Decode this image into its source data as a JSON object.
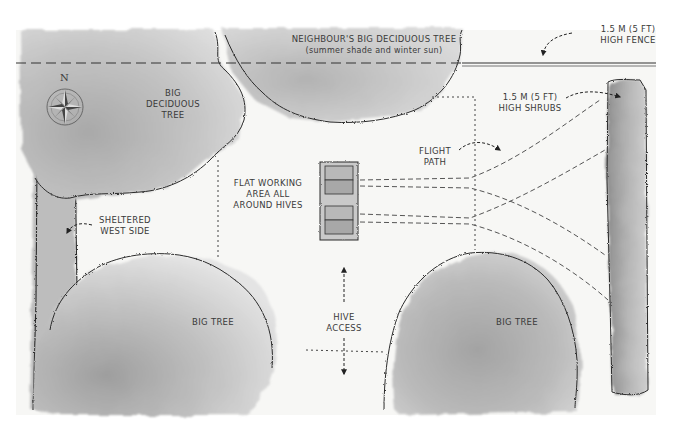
{
  "diagram": {
    "type": "garden beehive siting plan",
    "style": "grayscale watercolor",
    "labels": {
      "neighbour_tree_title": "NEIGHBOUR'S BIG DECIDUOUS TREE",
      "neighbour_tree_note": "(summer shade and winter sun)",
      "fence_line1": "1.5 M (5 FT)",
      "fence_line2": "HIGH FENCE",
      "shrubs_line1": "1.5 M (5 FT)",
      "shrubs_line2": "HIGH SHRUBS",
      "big_deciduous_line1": "BIG",
      "big_deciduous_line2": "DECIDUOUS",
      "big_deciduous_line3": "TREE",
      "north": "N",
      "flight_line1": "FLIGHT",
      "flight_line2": "PATH",
      "working_line1": "FLAT WORKING",
      "working_line2": "AREA ALL",
      "working_line3": "AROUND HIVES",
      "sheltered_line1": "SHELTERED",
      "sheltered_line2": "WEST SIDE",
      "big_tree_left": "BIG TREE",
      "big_tree_right": "BIG TREE",
      "hive_access_line1": "HIVE",
      "hive_access_line2": "ACCESS"
    },
    "elements": [
      {
        "id": "neighbour-tree",
        "kind": "tree",
        "position": "top-center"
      },
      {
        "id": "big-deciduous-tree",
        "kind": "tree",
        "position": "top-left"
      },
      {
        "id": "big-tree-left",
        "kind": "tree",
        "position": "bottom-left"
      },
      {
        "id": "big-tree-right",
        "kind": "tree",
        "position": "bottom-right"
      },
      {
        "id": "west-hedge",
        "kind": "hedge",
        "position": "left edge"
      },
      {
        "id": "east-shrubs",
        "kind": "shrubs",
        "position": "right edge"
      },
      {
        "id": "fence",
        "kind": "fence",
        "position": "top edge"
      },
      {
        "id": "hives",
        "kind": "beehives",
        "count": 2,
        "position": "center"
      },
      {
        "id": "flight-paths",
        "kind": "dashed lines",
        "count": 4,
        "direction": "east"
      }
    ],
    "colors": {
      "ink": "#2a2a2a",
      "wash_light": "#d9d9d9",
      "wash_mid": "#bdbdbd",
      "wash_dark": "#9a9a9a",
      "paper": "#f7f7f5"
    }
  }
}
